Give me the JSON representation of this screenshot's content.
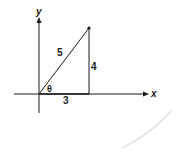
{
  "diagram": {
    "type": "right-triangle-on-axes",
    "axes": {
      "x_label": "x",
      "y_label": "y"
    },
    "triangle": {
      "hypotenuse_label": "5",
      "opposite_label": "4",
      "adjacent_label": "3",
      "angle_label": "θ"
    },
    "colors": {
      "line": "#1a1a1a",
      "background": "#ffffff",
      "arc": "#d8d8d8"
    }
  }
}
